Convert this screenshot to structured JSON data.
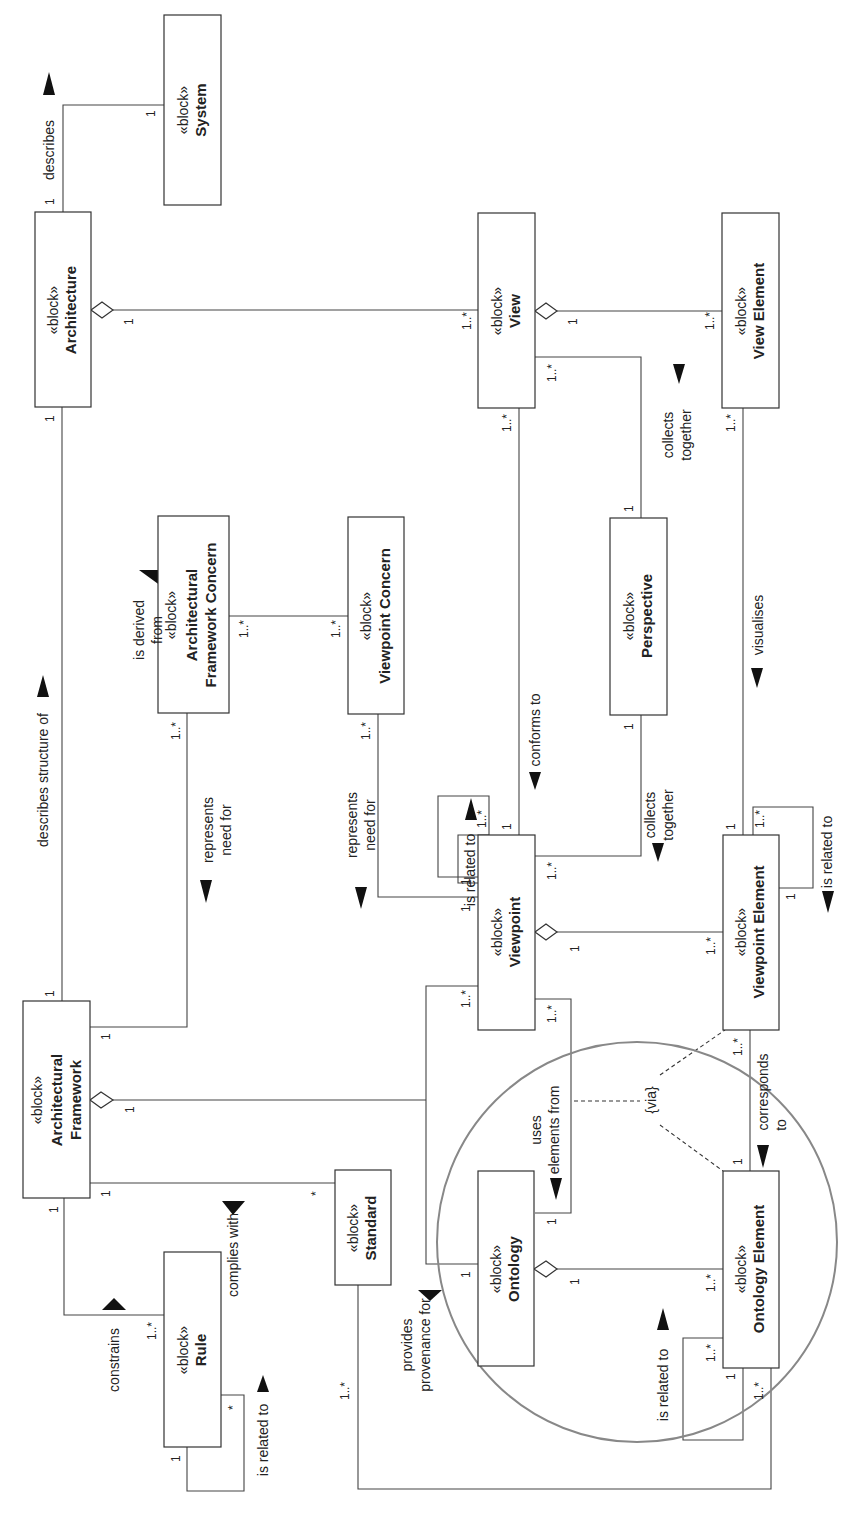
{
  "diagram": {
    "orientation": "rotated 90 degrees counter-clockwise",
    "stereotype": "«block»",
    "blocks": {
      "system": {
        "stereotype": "«block»",
        "name": "System"
      },
      "architecture": {
        "stereotype": "«block»",
        "name": "Architecture"
      },
      "view": {
        "stereotype": "«block»",
        "name": "View"
      },
      "view_element": {
        "stereotype": "«block»",
        "name": "View Element"
      },
      "af_concern": {
        "stereotype": "«block»",
        "name_line1": "Architectural",
        "name_line2": "Framework Concern"
      },
      "viewpoint_concern": {
        "stereotype": "«block»",
        "name": "Viewpoint Concern"
      },
      "perspective": {
        "stereotype": "«block»",
        "name": "Perspective"
      },
      "viewpoint": {
        "stereotype": "«block»",
        "name": "Viewpoint"
      },
      "viewpoint_element": {
        "stereotype": "«block»",
        "name": "Viewpoint Element"
      },
      "architectural_framework": {
        "stereotype": "«block»",
        "name_line1": "Architectural",
        "name_line2": "Framework"
      },
      "ontology": {
        "stereotype": "«block»",
        "name": "Ontology"
      },
      "ontology_element": {
        "stereotype": "«block»",
        "name": "Ontology Element"
      },
      "standard": {
        "stereotype": "«block»",
        "name": "Standard"
      },
      "rule": {
        "stereotype": "«block»",
        "name": "Rule"
      }
    },
    "relationships": {
      "describes": {
        "label": "describes",
        "mult_a": "1",
        "mult_b": "1"
      },
      "describes_structure_of": {
        "label": "describes structure of",
        "mult_a": "1",
        "mult_b": "1"
      },
      "arch_view_agg": {
        "mult_a": "1",
        "mult_b": "1..*"
      },
      "view_viewelement_agg": {
        "mult_a": "1",
        "mult_b": "1..*"
      },
      "is_derived_from": {
        "label_line1": "is derived",
        "label_line2": "from",
        "mult_a": "1..*",
        "mult_b": "1..*"
      },
      "af_represents_need_for": {
        "label_line1": "represents",
        "label_line2": "need for",
        "mult_a": "1",
        "mult_b": "1..*"
      },
      "vp_represents_need_for": {
        "label_line1": "represents",
        "label_line2": "need for",
        "mult_a": "1",
        "mult_b": "1..*"
      },
      "conforms_to": {
        "label": "conforms to",
        "mult_a": "1",
        "mult_b": "1..*"
      },
      "persp_collects_view": {
        "label_line1": "collects",
        "label_line2": "together",
        "mult_a": "1",
        "mult_b": "1..*"
      },
      "persp_collects_vp": {
        "label_line1": "collects",
        "label_line2": "together",
        "mult_a": "1",
        "mult_b": "1..*"
      },
      "visualises": {
        "label": "visualises",
        "mult_a": "1",
        "mult_b": "1..*"
      },
      "vp_is_related_to": {
        "label": "is related to",
        "mult_a": "1",
        "mult_b": "1..*"
      },
      "vpe_is_related_to": {
        "label": "is related to",
        "mult_a": "1",
        "mult_b": "1..*"
      },
      "vp_vpe_agg": {
        "mult_a": "1",
        "mult_b": "1..*"
      },
      "af_vp_agg": {
        "mult_a": "1",
        "mult_b": "1..*"
      },
      "af_ontology": {
        "mult_b": "1"
      },
      "uses_elements_from": {
        "label_line1": "uses",
        "label_line2": "elements from",
        "mult_a": "1..*",
        "mult_b": "1"
      },
      "via": {
        "label": "{via}"
      },
      "corresponds_to": {
        "label_line1": "corresponds",
        "label_line2": "to",
        "mult_a": "1..*",
        "mult_b": "1"
      },
      "ontology_oe_agg": {
        "mult_a": "1",
        "mult_b": "1..*"
      },
      "oe_is_related_to": {
        "label": "is related to",
        "mult_a": "1",
        "mult_b": "1..*"
      },
      "complies_with": {
        "label": "complies with",
        "mult_a": "1",
        "mult_b": "*"
      },
      "constrains": {
        "label": "constrains",
        "mult_a": "1",
        "mult_b": "1..*"
      },
      "rule_is_related_to": {
        "label": "is related to",
        "mult_a": "1",
        "mult_b": "*"
      },
      "provides_provenance_for": {
        "label_line1": "provides",
        "label_line2": "provenance for",
        "mult_a": "1..*",
        "mult_b": "1..*"
      }
    },
    "highlight_circle_color": "#888888"
  }
}
